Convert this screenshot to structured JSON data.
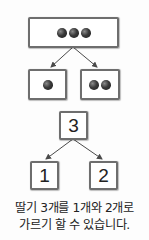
{
  "diagram_top": {
    "whole": {
      "count": 3,
      "item": "strawberry"
    },
    "parts": [
      {
        "count": 1,
        "item": "strawberry"
      },
      {
        "count": 2,
        "item": "strawberry"
      }
    ]
  },
  "diagram_bottom": {
    "whole": "3",
    "parts": [
      "1",
      "2"
    ]
  },
  "caption": {
    "line1": "딸기 3개를 1개와 2개로",
    "line2": "가르기 할 수 있습니다."
  },
  "colors": {
    "border": "#6e6e6e",
    "arrow": "#4a4a4a",
    "text": "#222222",
    "background": "#fdfdfd"
  }
}
